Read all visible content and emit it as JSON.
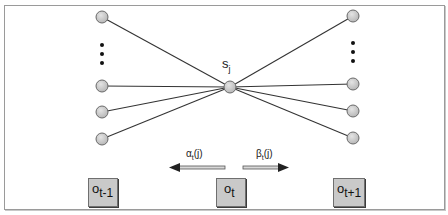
{
  "diagram": {
    "type": "hmm-forward-backward-illustration",
    "center_state": {
      "label": "s",
      "subscript": "j"
    },
    "left_column": {
      "node_count_visible": 4,
      "has_ellipsis": true
    },
    "right_column": {
      "node_count_visible": 4,
      "has_ellipsis": true
    },
    "arrows": {
      "alpha": {
        "label": "α",
        "sub": "t",
        "arg": "(j)",
        "direction": "left"
      },
      "beta": {
        "label": "β",
        "sub": "t",
        "arg": "(j)",
        "direction": "right"
      }
    },
    "observations": [
      {
        "base": "o",
        "sub": "t-1"
      },
      {
        "base": "o",
        "sub": "t"
      },
      {
        "base": "o",
        "sub": "t+1"
      }
    ],
    "colors": {
      "node_fill": "#c8c8c8",
      "node_stroke": "#6a6a6a",
      "edge": "#333333",
      "box_fill": "#c9c9c9",
      "frame": "#9a9a9a"
    }
  }
}
